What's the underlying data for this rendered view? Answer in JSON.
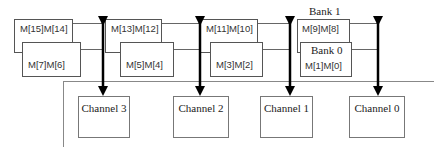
{
  "diagram": {
    "banks": [
      {
        "label": "Bank 1",
        "modules": [
          "M[15]M[14]",
          "M[13]M[12]",
          "M[11]M[10]",
          "M[9]M[8]"
        ]
      },
      {
        "label": "Bank 0",
        "modules": [
          "M[7]M[6]",
          "M[5]M[4]",
          "M[3]M[2]",
          "M[1]M[0]"
        ]
      }
    ],
    "channels": [
      "Channel 3",
      "Channel 2",
      "Channel 1",
      "Channel 0"
    ],
    "colors": {
      "line": "#666666",
      "arrow": "#000000",
      "box_border": "#555555",
      "text": "#222222"
    }
  }
}
